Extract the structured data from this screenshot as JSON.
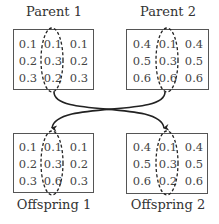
{
  "diagram": {
    "parents": [
      {
        "label": "Parent 1",
        "matrix": [
          [
            "0.1",
            "0.1",
            "0.1"
          ],
          [
            "0.2",
            "0.3",
            "0.2"
          ],
          [
            "0.3",
            "0.2",
            "0.3"
          ]
        ]
      },
      {
        "label": "Parent 2",
        "matrix": [
          [
            "0.4",
            "0.1",
            "0.4"
          ],
          [
            "0.5",
            "0.3",
            "0.5"
          ],
          [
            "0.6",
            "0.6",
            "0.6"
          ]
        ]
      }
    ],
    "offspring": [
      {
        "label": "Offspring 1",
        "matrix": [
          [
            "0.1",
            "0.1",
            "0.1"
          ],
          [
            "0.2",
            "0.3",
            "0.2"
          ],
          [
            "0.3",
            "0.6",
            "0.3"
          ]
        ]
      },
      {
        "label": "Offspring 2",
        "matrix": [
          [
            "0.4",
            "0.1",
            "0.4"
          ],
          [
            "0.5",
            "0.3",
            "0.5"
          ],
          [
            "0.6",
            "0.2",
            "0.6"
          ]
        ]
      }
    ],
    "highlight": "middle column circled with dashed ellipse",
    "arrows": [
      {
        "from": "Parent 1",
        "to": "Offspring 2"
      },
      {
        "from": "Parent 2",
        "to": "Offspring 1"
      }
    ],
    "colors": {
      "line": "#222222",
      "box_border": "#555555",
      "text": "#444444"
    }
  }
}
